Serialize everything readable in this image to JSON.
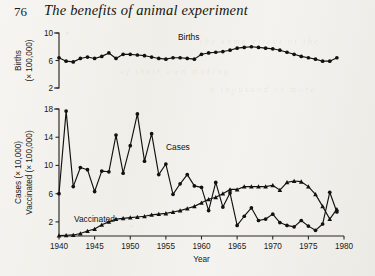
{
  "page": {
    "number": "76",
    "running_head": "The benefits of animal experiment"
  },
  "bleed_through": [
    {
      "text": "the same effect of the",
      "x": 200,
      "y": 36
    },
    {
      "text": "of their own making",
      "x": 120,
      "y": 66
    },
    {
      "text": "a thousand or more",
      "x": 210,
      "y": 84
    }
  ],
  "chart_data": [
    {
      "type": "line",
      "id": "births",
      "title": "",
      "series_label": "Births",
      "xlabel": "",
      "ylabel": "Births (× 100,000)",
      "ylabel_lines": [
        "Births",
        "(× 100,000)"
      ],
      "xlim": [
        1940,
        1980
      ],
      "ylim": [
        2,
        10
      ],
      "yticks": [
        2,
        6,
        10
      ],
      "ytick_labels": [
        "2",
        "6",
        "10"
      ],
      "xticks": [
        1940,
        1945,
        1950,
        1955,
        1960,
        1965,
        1970,
        1975,
        1980
      ],
      "grid": false,
      "marker": "circle",
      "x": [
        1940,
        1941,
        1942,
        1943,
        1944,
        1945,
        1946,
        1947,
        1948,
        1949,
        1950,
        1951,
        1952,
        1953,
        1954,
        1955,
        1956,
        1957,
        1958,
        1959,
        1960,
        1961,
        1962,
        1963,
        1964,
        1965,
        1966,
        1967,
        1968,
        1969,
        1970,
        1971,
        1972,
        1973,
        1974,
        1975,
        1976,
        1977,
        1978,
        1979
      ],
      "values": [
        6.4,
        5.9,
        5.8,
        6.3,
        6.5,
        6.3,
        6.6,
        7.1,
        6.3,
        6.9,
        6.9,
        6.8,
        6.7,
        6.5,
        6.3,
        6.2,
        6.4,
        6.4,
        6.3,
        6.2,
        6.9,
        7.1,
        7.2,
        7.3,
        7.5,
        7.8,
        7.9,
        8.0,
        7.9,
        7.8,
        7.7,
        7.5,
        7.2,
        6.9,
        6.6,
        6.4,
        6.2,
        5.9,
        5.9,
        6.4
      ]
    },
    {
      "type": "line",
      "id": "cases-vaccinated",
      "title": "",
      "xlabel": "Year",
      "ylabel": "Cases (× 10,000) / Vaccinated (× 100,000)",
      "ylabel_lines": [
        "Cases (× 10,000)",
        "Vaccinated (× 100,000)"
      ],
      "xlim": [
        1940,
        1980
      ],
      "ylim": [
        0,
        18
      ],
      "yticks": [
        2,
        6,
        10,
        14,
        18
      ],
      "ytick_labels": [
        "2",
        "6",
        "10",
        "14",
        "18"
      ],
      "xticks": [
        1940,
        1945,
        1950,
        1955,
        1960,
        1965,
        1970,
        1975,
        1980
      ],
      "xtick_labels": [
        "1940",
        "1945",
        "1950",
        "1955",
        "1960",
        "1965",
        "1970",
        "1975",
        "1980"
      ],
      "grid": false,
      "series": [
        {
          "name": "Cases",
          "marker": "circle",
          "x": [
            1940,
            1941,
            1942,
            1943,
            1944,
            1945,
            1946,
            1947,
            1948,
            1949,
            1950,
            1951,
            1952,
            1953,
            1954,
            1955,
            1956,
            1957,
            1958,
            1959,
            1960,
            1961,
            1962,
            1963,
            1964,
            1965,
            1966,
            1967,
            1968,
            1969,
            1970,
            1971,
            1972,
            1973,
            1974,
            1975,
            1976,
            1977,
            1978,
            1979
          ],
          "values": [
            6.0,
            17.7,
            7.0,
            9.7,
            9.4,
            6.3,
            9.2,
            9.1,
            14.3,
            8.9,
            12.8,
            17.3,
            10.6,
            14.5,
            8.7,
            10.2,
            5.9,
            7.4,
            8.7,
            7.1,
            6.9,
            3.6,
            7.6,
            4.1,
            6.1,
            1.5,
            2.8,
            4.0,
            2.2,
            2.4,
            3.1,
            1.9,
            1.5,
            1.3,
            2.2,
            1.4,
            0.8,
            1.7,
            6.2,
            3.4
          ]
        },
        {
          "name": "Vaccinated",
          "marker": "triangle",
          "x": [
            1940,
            1941,
            1942,
            1943,
            1944,
            1945,
            1946,
            1947,
            1948,
            1949,
            1950,
            1951,
            1952,
            1953,
            1954,
            1955,
            1956,
            1957,
            1958,
            1959,
            1960,
            1961,
            1962,
            1963,
            1964,
            1965,
            1966,
            1967,
            1968,
            1969,
            1970,
            1971,
            1972,
            1973,
            1974,
            1975,
            1976,
            1977,
            1978,
            1979
          ],
          "values": [
            0.05,
            0.1,
            0.15,
            0.35,
            0.7,
            1.0,
            1.6,
            2.0,
            2.4,
            2.5,
            2.6,
            2.7,
            2.8,
            3.0,
            3.1,
            3.2,
            3.4,
            3.6,
            3.9,
            4.2,
            4.7,
            5.2,
            5.5,
            6.0,
            6.6,
            6.6,
            7.0,
            7.0,
            7.0,
            7.0,
            7.2,
            6.5,
            7.6,
            7.8,
            7.7,
            7.0,
            5.9,
            4.2,
            2.4,
            3.8
          ]
        }
      ]
    }
  ]
}
